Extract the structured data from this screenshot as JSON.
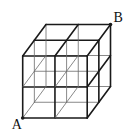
{
  "diagram": {
    "labels": {
      "start": "A",
      "end": "B"
    },
    "grid": {
      "nx": 2,
      "ny": 2,
      "nz": 2
    },
    "colors": {
      "line": "#1a1a1a",
      "hidden_line": "#6a6a6a",
      "background": "#ffffff"
    }
  }
}
